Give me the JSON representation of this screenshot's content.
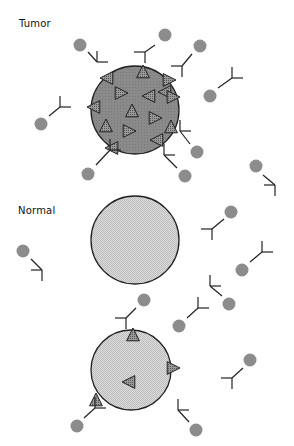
{
  "labels": {
    "tumor": "Tumor",
    "normal": "Normal"
  },
  "colors": {
    "tumor_cell_fill": "#8a8a8a",
    "normal_cell_fill": "#d4d4d4",
    "toxin_ball": "#8c8c8c",
    "outline": "#222222",
    "antigen_fill": "#777777"
  },
  "cells": [
    {
      "id": "tumor-cell",
      "type": "tumor",
      "cx": 135,
      "cy": 110,
      "r": 44
    },
    {
      "id": "normal-cell-1",
      "type": "normal",
      "cx": 135,
      "cy": 240,
      "r": 44
    },
    {
      "id": "normal-cell-2",
      "type": "normal",
      "cx": 131,
      "cy": 370,
      "r": 40
    }
  ],
  "antigens": [
    {
      "cx": 143,
      "cy": 73,
      "dir": "up"
    },
    {
      "cx": 108,
      "cy": 78,
      "dir": "left"
    },
    {
      "cx": 168,
      "cy": 80,
      "dir": "right"
    },
    {
      "cx": 166,
      "cy": 92,
      "dir": "left"
    },
    {
      "cx": 95,
      "cy": 107,
      "dir": "left"
    },
    {
      "cx": 120,
      "cy": 93,
      "dir": "right"
    },
    {
      "cx": 150,
      "cy": 96,
      "dir": "left"
    },
    {
      "cx": 172,
      "cy": 97,
      "dir": "right"
    },
    {
      "cx": 132,
      "cy": 112,
      "dir": "up"
    },
    {
      "cx": 154,
      "cy": 118,
      "dir": "right"
    },
    {
      "cx": 106,
      "cy": 127,
      "dir": "up"
    },
    {
      "cx": 128,
      "cy": 131,
      "dir": "right"
    },
    {
      "cx": 171,
      "cy": 128,
      "dir": "up"
    },
    {
      "cx": 158,
      "cy": 140,
      "dir": "left"
    },
    {
      "cx": 113,
      "cy": 148,
      "dir": "left"
    },
    {
      "cx": 133,
      "cy": 336,
      "dir": "up"
    },
    {
      "cx": 172,
      "cy": 368,
      "dir": "right"
    },
    {
      "cx": 130,
      "cy": 382,
      "dir": "left"
    },
    {
      "cx": 96,
      "cy": 401,
      "dir": "up"
    }
  ],
  "antibodies": [
    {
      "ball": [
        80,
        45
      ],
      "stem": [
        [
          88,
          52
        ],
        [
          97,
          62
        ]
      ],
      "fork": "right"
    },
    {
      "ball": [
        200,
        46
      ],
      "stem": [
        [
          192,
          54
        ],
        [
          182,
          66
        ]
      ],
      "fork": "down"
    },
    {
      "ball": [
        165,
        35
      ],
      "stem": [
        [
          155,
          45
        ],
        [
          145,
          52
        ]
      ],
      "fork": "down"
    },
    {
      "ball": [
        210,
        96
      ],
      "stem": [
        [
          218,
          88
        ],
        [
          232,
          78
        ]
      ],
      "fork": "up"
    },
    {
      "ball": [
        41,
        124
      ],
      "stem": [
        [
          49,
          116
        ],
        [
          60,
          107
        ]
      ],
      "fork": "up"
    },
    {
      "ball": [
        88,
        174
      ],
      "stem": [
        [
          96,
          165
        ],
        [
          110,
          150
        ]
      ],
      "fork": "up"
    },
    {
      "ball": [
        197,
        152
      ],
      "stem": [
        [
          190,
          144
        ],
        [
          180,
          131
        ]
      ],
      "fork": "up"
    },
    {
      "ball": [
        185,
        176
      ],
      "stem": [
        [
          177,
          168
        ],
        [
          164,
          155
        ]
      ],
      "fork": "up"
    },
    {
      "ball": [
        256,
        166
      ],
      "stem": [
        [
          263,
          175
        ],
        [
          275,
          185
        ]
      ],
      "fork": "down"
    },
    {
      "ball": [
        23,
        251
      ],
      "stem": [
        [
          31,
          259
        ],
        [
          42,
          270
        ]
      ],
      "fork": "down"
    },
    {
      "ball": [
        231,
        212
      ],
      "stem": [
        [
          224,
          219
        ],
        [
          212,
          229
        ]
      ],
      "fork": "down"
    },
    {
      "ball": [
        242,
        270
      ],
      "stem": [
        [
          250,
          262
        ],
        [
          262,
          252
        ]
      ],
      "fork": "up"
    },
    {
      "ball": [
        229,
        304
      ],
      "stem": [
        [
          222,
          296
        ],
        [
          210,
          286
        ]
      ],
      "fork": "up"
    },
    {
      "ball": [
        179,
        326
      ],
      "stem": [
        [
          187,
          318
        ],
        [
          198,
          308
        ]
      ],
      "fork": "up"
    },
    {
      "ball": [
        144,
        300
      ],
      "stem": [
        [
          136,
          308
        ],
        [
          126,
          318
        ]
      ],
      "fork": "down"
    },
    {
      "ball": [
        250,
        360
      ],
      "stem": [
        [
          243,
          368
        ],
        [
          232,
          378
        ]
      ],
      "fork": "down"
    },
    {
      "ball": [
        77,
        426
      ],
      "stem": [
        [
          84,
          418
        ],
        [
          95,
          408
        ]
      ],
      "fork": "up"
    },
    {
      "ball": [
        196,
        430
      ],
      "stem": [
        [
          189,
          422
        ],
        [
          178,
          410
        ]
      ],
      "fork": "up"
    }
  ]
}
